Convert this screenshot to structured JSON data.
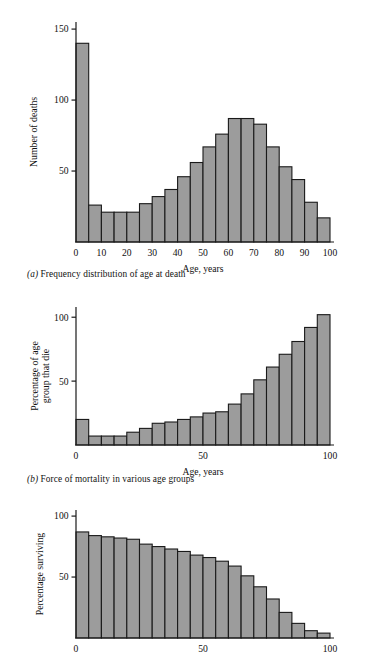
{
  "figure": {
    "panels": [
      {
        "id": "a",
        "caption_label": "(a)",
        "caption_text": "Frequency distribution of age at death",
        "chart_data": {
          "type": "bar",
          "title": "Frequency distribution of age at death",
          "xlabel": "Age, years",
          "ylabel": "Number of deaths",
          "xlim": [
            0,
            100
          ],
          "ylim": [
            0,
            155
          ],
          "xticks": [
            "0",
            "10",
            "20",
            "30",
            "40",
            "50",
            "60",
            "70",
            "80",
            "90",
            "100"
          ],
          "xtick_values": [
            0,
            10,
            20,
            30,
            40,
            50,
            60,
            70,
            80,
            90,
            100
          ],
          "yticks": [
            "50",
            "100",
            "150"
          ],
          "ytick_values": [
            50,
            100,
            150
          ],
          "grid": false,
          "legend": "none",
          "bin_width": 5,
          "categories": [
            "0-5",
            "5-10",
            "10-15",
            "15-20",
            "20-25",
            "25-30",
            "30-35",
            "35-40",
            "40-45",
            "45-50",
            "50-55",
            "55-60",
            "60-65",
            "65-70",
            "70-75",
            "75-80",
            "80-85",
            "85-90",
            "90-95",
            "95-100"
          ],
          "values": [
            140,
            26,
            21,
            21,
            21,
            27,
            32,
            37,
            46,
            56,
            67,
            76,
            87,
            87,
            83,
            67,
            53,
            44,
            28,
            17
          ]
        }
      },
      {
        "id": "b",
        "caption_label": "(b)",
        "caption_text": "Force of mortality in various age groups",
        "chart_data": {
          "type": "bar",
          "title": "Force of mortality in various age groups",
          "xlabel": "Age, years",
          "ylabel": "Percentage of age group that die",
          "xlim": [
            0,
            100
          ],
          "ylim": [
            0,
            108
          ],
          "xticks": [
            "0",
            "50",
            "100"
          ],
          "xtick_values": [
            0,
            50,
            100
          ],
          "yticks": [
            "50",
            "100"
          ],
          "ytick_values": [
            50,
            100
          ],
          "grid": false,
          "legend": "none",
          "bin_width": 5,
          "categories": [
            "0-5",
            "5-10",
            "10-15",
            "15-20",
            "20-25",
            "25-30",
            "30-35",
            "35-40",
            "40-45",
            "45-50",
            "50-55",
            "55-60",
            "60-65",
            "65-70",
            "70-75",
            "75-80",
            "80-85",
            "85-90",
            "90-95",
            "95-100"
          ],
          "values": [
            20,
            7,
            7,
            7,
            10,
            13,
            17,
            18,
            20,
            22,
            25,
            26,
            32,
            40,
            51,
            61,
            71,
            81,
            92,
            102
          ]
        }
      },
      {
        "id": "c",
        "caption_label": "(c)",
        "caption_text": "",
        "chart_data": {
          "type": "bar",
          "title": "Percentage surviving",
          "xlabel": "",
          "ylabel": "Percentage surviving",
          "xlim": [
            0,
            100
          ],
          "ylim": [
            0,
            105
          ],
          "xticks": [
            "0",
            "50",
            "100"
          ],
          "xtick_values": [
            0,
            50,
            100
          ],
          "yticks": [
            "50",
            "100"
          ],
          "ytick_values": [
            50,
            100
          ],
          "grid": false,
          "legend": "none",
          "bin_width": 5,
          "categories": [
            "0-5",
            "5-10",
            "10-15",
            "15-20",
            "20-25",
            "25-30",
            "30-35",
            "35-40",
            "40-45",
            "45-50",
            "50-55",
            "55-60",
            "60-65",
            "65-70",
            "70-75",
            "75-80",
            "80-85",
            "85-90",
            "90-95",
            "95-100"
          ],
          "values": [
            87,
            84,
            83,
            82,
            81,
            77,
            75,
            73,
            71,
            68,
            66,
            63,
            59,
            51,
            42,
            32,
            21,
            12,
            6,
            4
          ]
        }
      }
    ]
  },
  "style": {
    "bar_fill": "#9c9c9c",
    "bar_stroke": "#1a1a1a",
    "axis_color": "#1a1a1a",
    "background": "#ffffff"
  }
}
